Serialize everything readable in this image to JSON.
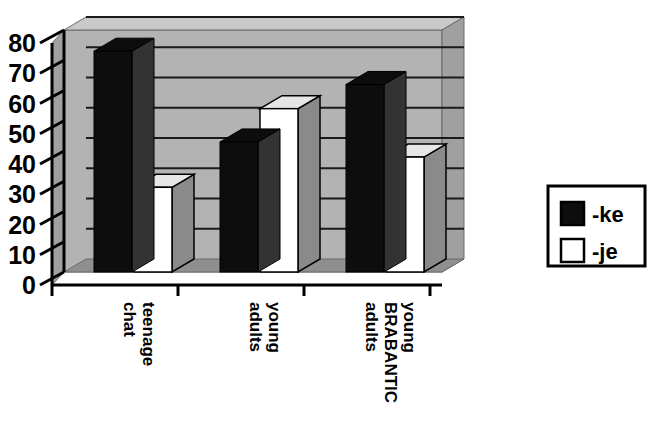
{
  "chart_data": {
    "type": "bar",
    "title": "",
    "subtitle": "",
    "xlabel": "",
    "ylabel": "",
    "categories": [
      "teenage chat",
      "young adults",
      "young BRABANTIC adults"
    ],
    "category_lines": [
      [
        "teenage",
        "chat"
      ],
      [
        "young",
        "adults"
      ],
      [
        "young",
        "BRABANTIC",
        "adults"
      ]
    ],
    "series": [
      {
        "name": "-ke",
        "values": [
          73,
          43,
          62
        ],
        "color": "#0d0d0d",
        "style": "filled-black"
      },
      {
        "name": "-je",
        "values": [
          28,
          54,
          38
        ],
        "color": "#ffffff",
        "style": "outlined-white"
      }
    ],
    "ylim": [
      0,
      80
    ],
    "yticks": [
      0,
      10,
      20,
      30,
      40,
      50,
      60,
      70,
      80
    ],
    "ytick_labels": [
      "0",
      "10",
      "20",
      "30",
      "40",
      "50",
      "60",
      "70",
      "80"
    ],
    "grid": true,
    "grid_axis": "y",
    "legend_position": "right",
    "three_d": true,
    "plot_background": "#b3b3b3",
    "legend_entries": [
      {
        "label": "-ke",
        "swatch": "black"
      },
      {
        "label": "-je",
        "swatch": "white"
      }
    ]
  },
  "colors": {
    "plot_fill": "#b3b3b3",
    "plot_top": "#c9c9c9",
    "plot_side": "#a0a0a0",
    "floor": "#8f8f8f",
    "bar_black": "#0d0d0d",
    "bar_black_side": "#333333",
    "bar_white": "#ffffff",
    "bar_white_side": "#8a8a8a",
    "bar_white_top": "#e6e6e6",
    "axis": "#000000",
    "grid": "#1a1a1a",
    "legend_border": "#000000",
    "page_background": "#ffffff"
  }
}
